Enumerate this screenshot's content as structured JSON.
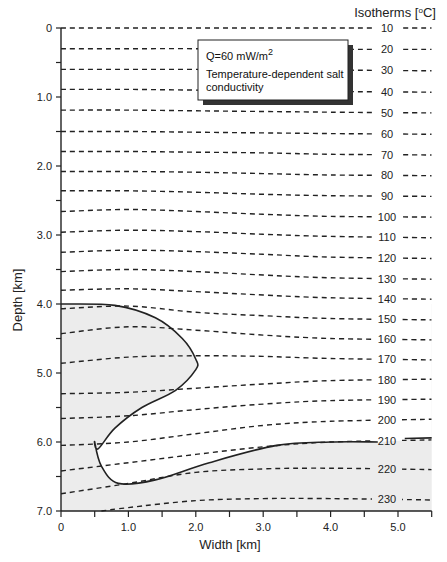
{
  "chart_data": {
    "type": "line",
    "title": "",
    "xlabel": "Width [km]",
    "ylabel": "Depth [km]",
    "xlim": [
      0,
      5.5
    ],
    "ylim": [
      7.0,
      0
    ],
    "x_ticks": [
      0,
      0.5,
      1.0,
      1.5,
      2.0,
      2.5,
      3.0,
      3.5,
      4.0,
      4.5,
      5.0,
      5.5
    ],
    "x_tick_labels": [
      "0",
      "1.0",
      "2.0",
      "3.0",
      "4.0",
      "5.0"
    ],
    "x_tick_label_values": [
      0,
      1.0,
      2.0,
      3.0,
      4.0,
      5.0
    ],
    "y_ticks": [
      0,
      0.5,
      1.0,
      1.5,
      2.0,
      2.5,
      3.0,
      3.5,
      4.0,
      4.5,
      5.0,
      5.5,
      6.0,
      6.5,
      7.0
    ],
    "y_tick_labels": [
      "0",
      "1.0",
      "2.0",
      "3.0",
      "4.0",
      "5.0",
      "6.0",
      "7.0"
    ],
    "y_tick_label_values": [
      0,
      1.0,
      2.0,
      3.0,
      4.0,
      5.0,
      6.0,
      7.0
    ],
    "grid": false,
    "isotherm_header": "Isotherms [oC]",
    "legend_box": {
      "line1": "Q=60 mW/m",
      "line1_sup": "2",
      "line2": "Temperature-dependent salt",
      "line3": "conductivity"
    },
    "series": [
      {
        "name": "10",
        "x": [
          0,
          1,
          2,
          3,
          4,
          5.5
        ],
        "y": [
          0.0,
          0.0,
          0.0,
          0.0,
          0.0,
          0.0
        ]
      },
      {
        "name": "20",
        "x": [
          0,
          1,
          2,
          3,
          4,
          5.5
        ],
        "y": [
          0.3,
          0.3,
          0.3,
          0.31,
          0.31,
          0.31
        ]
      },
      {
        "name": "30",
        "x": [
          0,
          1,
          2,
          3,
          4,
          5.5
        ],
        "y": [
          0.6,
          0.6,
          0.6,
          0.61,
          0.61,
          0.62
        ]
      },
      {
        "name": "40",
        "x": [
          0,
          1,
          2,
          3,
          4,
          5.5
        ],
        "y": [
          0.89,
          0.89,
          0.9,
          0.91,
          0.92,
          0.93
        ]
      },
      {
        "name": "50",
        "x": [
          0,
          1,
          2,
          3,
          4,
          5.5
        ],
        "y": [
          1.19,
          1.19,
          1.2,
          1.21,
          1.22,
          1.23
        ]
      },
      {
        "name": "60",
        "x": [
          0,
          1,
          2,
          3,
          4,
          5.5
        ],
        "y": [
          1.5,
          1.5,
          1.51,
          1.52,
          1.53,
          1.54
        ]
      },
      {
        "name": "70",
        "x": [
          0,
          1,
          2,
          3,
          4,
          5.5
        ],
        "y": [
          1.79,
          1.79,
          1.8,
          1.81,
          1.83,
          1.84
        ]
      },
      {
        "name": "80",
        "x": [
          0,
          1,
          2,
          3,
          4,
          5.5
        ],
        "y": [
          2.08,
          2.08,
          2.09,
          2.11,
          2.13,
          2.14
        ]
      },
      {
        "name": "90",
        "x": [
          0,
          1,
          2,
          3,
          4,
          5.5
        ],
        "y": [
          2.36,
          2.36,
          2.38,
          2.41,
          2.43,
          2.44
        ]
      },
      {
        "name": "100",
        "x": [
          0,
          1,
          2,
          3,
          4,
          5.5
        ],
        "y": [
          2.66,
          2.63,
          2.66,
          2.7,
          2.73,
          2.74
        ]
      },
      {
        "name": "110",
        "x": [
          0,
          1,
          2,
          3,
          4,
          5.5
        ],
        "y": [
          2.96,
          2.93,
          2.95,
          2.99,
          3.02,
          3.04
        ]
      },
      {
        "name": "120",
        "x": [
          0,
          1,
          2,
          3,
          4,
          5.5
        ],
        "y": [
          3.25,
          3.22,
          3.24,
          3.28,
          3.32,
          3.34
        ]
      },
      {
        "name": "130",
        "x": [
          0,
          1,
          2,
          3,
          4,
          5.5
        ],
        "y": [
          3.53,
          3.5,
          3.53,
          3.58,
          3.62,
          3.64
        ]
      },
      {
        "name": "140",
        "x": [
          0,
          1,
          2,
          3,
          4,
          5.5
        ],
        "y": [
          3.8,
          3.78,
          3.82,
          3.87,
          3.91,
          3.93
        ]
      },
      {
        "name": "150",
        "x": [
          0,
          1,
          2,
          3,
          4,
          5.5
        ],
        "y": [
          4.07,
          4.03,
          4.12,
          4.17,
          4.21,
          4.23
        ]
      },
      {
        "name": "160",
        "x": [
          0,
          1,
          2,
          3,
          4,
          5.5
        ],
        "y": [
          4.43,
          4.33,
          4.38,
          4.45,
          4.5,
          4.52
        ]
      },
      {
        "name": "170",
        "x": [
          0,
          1,
          2,
          3,
          4,
          5.5
        ],
        "y": [
          4.86,
          4.77,
          4.75,
          4.76,
          4.79,
          4.81
        ]
      },
      {
        "name": "180",
        "x": [
          0,
          1,
          2,
          3,
          4,
          5.5
        ],
        "y": [
          5.3,
          5.28,
          5.22,
          5.16,
          5.11,
          5.09
        ]
      },
      {
        "name": "190",
        "x": [
          0,
          1,
          2,
          3,
          4,
          5.5
        ],
        "y": [
          5.66,
          5.62,
          5.53,
          5.45,
          5.4,
          5.38
        ]
      },
      {
        "name": "200",
        "x": [
          0,
          1,
          2,
          3,
          4,
          5.5
        ],
        "y": [
          6.05,
          6.0,
          5.88,
          5.76,
          5.7,
          5.67
        ]
      },
      {
        "name": "210",
        "x": [
          0,
          1,
          2,
          3,
          4,
          5.5
        ],
        "y": [
          6.42,
          6.3,
          6.18,
          6.07,
          6.0,
          5.97
        ]
      },
      {
        "name": "220",
        "x": [
          0,
          1,
          2,
          3,
          4,
          5.5
        ],
        "y": [
          6.75,
          6.6,
          6.44,
          6.39,
          6.38,
          6.4
        ]
      },
      {
        "name": "230",
        "x": [
          0.6,
          1,
          2,
          3,
          4,
          5.5
        ],
        "y": [
          7.0,
          6.95,
          6.85,
          6.82,
          6.82,
          6.84
        ]
      }
    ],
    "salt_body_outline": {
      "x": [
        0,
        0.8,
        1.4,
        1.8,
        2.0,
        2.0,
        1.7,
        1.2,
        0.8,
        0.55,
        0.5,
        0.6,
        0.85,
        1.4,
        2.2,
        3.2,
        4.0,
        4.7
      ],
      "y": [
        4.0,
        4.02,
        4.2,
        4.5,
        4.8,
        4.95,
        5.25,
        5.5,
        5.8,
        6.1,
        6.0,
        6.35,
        6.6,
        6.55,
        6.3,
        6.05,
        6.0,
        6.0
      ]
    },
    "salt_right_segment": {
      "x": [
        5.1,
        5.5
      ],
      "y": [
        5.95,
        5.94
      ]
    },
    "shaded_region": "sediments below 4.0 km outside salt body (light gray)"
  },
  "colors": {
    "line": "#222222",
    "shade": "#ececec",
    "background": "#ffffff",
    "shadow": "#333333"
  }
}
